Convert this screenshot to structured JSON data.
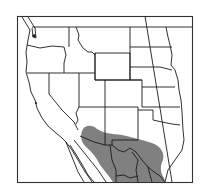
{
  "map": {
    "type": "species range map",
    "region": "Western United States and northern Mexico",
    "colors": {
      "background": "#ffffff",
      "frame": "#333333",
      "boundaries": "#1a1a1a",
      "range_fill": "#808080"
    },
    "range": {
      "label": "",
      "description": "Shaded range covering southern Arizona, southern New Mexico, west Texas and northern Mexico (Sonora, Chihuahua, Coahuila)"
    }
  }
}
